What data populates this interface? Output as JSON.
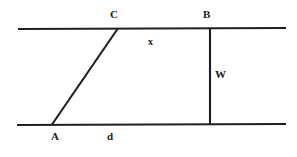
{
  "figure": {
    "background_color": "#ffffff",
    "stroke_color": "#1f1f1f",
    "text_color": "#1a1a1a",
    "width": 297,
    "height": 157
  },
  "labels": {
    "vertex_C": "C",
    "vertex_B": "B",
    "segment_x": "x",
    "segment_W": "W",
    "vertex_A": "A",
    "segment_d": "d"
  },
  "geometry": {
    "top_line": {
      "x1": 18,
      "y1": 29,
      "x2": 286,
      "y2": 28
    },
    "bottom_line": {
      "x1": 17,
      "y1": 125,
      "x2": 286,
      "y2": 124
    },
    "diagonal_line": {
      "x1": 52,
      "y1": 124,
      "x2": 117,
      "y2": 29
    },
    "vertical_line": {
      "x1": 210,
      "y1": 29,
      "x2": 210,
      "y2": 124
    },
    "stroke_width": 2
  }
}
